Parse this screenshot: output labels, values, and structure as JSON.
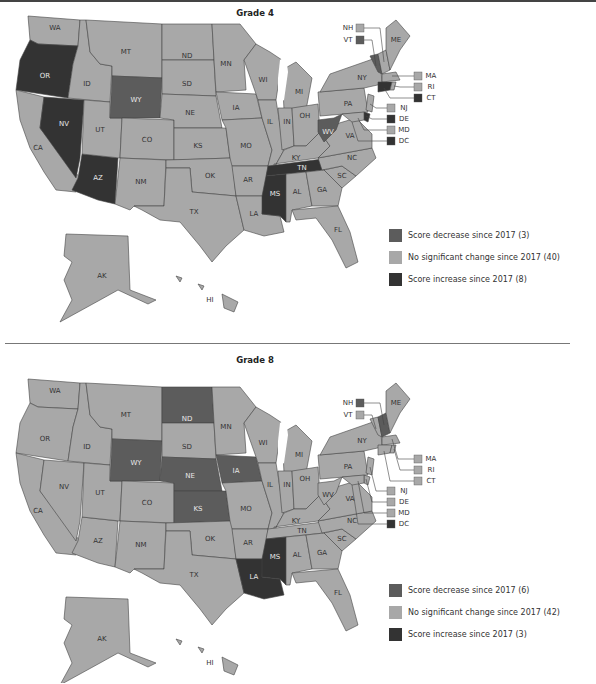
{
  "colors": {
    "decrease": "#5c5c5c",
    "no_change": "#a8a8a8",
    "increase": "#333333",
    "border": "#444444",
    "label_light": "#e8e8e8",
    "label_dark": "#333333"
  },
  "panels": [
    {
      "title": "Grade 4",
      "legend": [
        {
          "key": "decrease",
          "label": "Score decrease since 2017 (3)"
        },
        {
          "key": "no_change",
          "label": "No significant change since 2017 (40)"
        },
        {
          "key": "increase",
          "label": "Score increase since 2017 (8)"
        }
      ],
      "state_labels": {
        "WA": "WA",
        "OR": "OR",
        "CA": "CA",
        "ID": "ID",
        "NV": "NV",
        "AZ": "AZ",
        "UT": "UT",
        "MT": "MT",
        "WY": "WY",
        "CO": "CO",
        "NM": "NM",
        "ND": "ND",
        "SD": "SD",
        "NE": "NE",
        "KS": "KS",
        "OK": "OK",
        "TX": "TX",
        "MN": "MN",
        "IA": "IA",
        "MO": "MO",
        "AR": "AR",
        "LA": "LA",
        "WI": "WI",
        "IL": "IL",
        "MI": "MI",
        "IN": "IN",
        "OH": "OH",
        "KY": "KY",
        "TN": "TN",
        "MS": "MS",
        "AL": "AL",
        "GA": "GA",
        "FL": "FL",
        "SC": "SC",
        "NC": "NC",
        "VA": "VA",
        "WV": "WV",
        "PA": "PA",
        "NY": "NY",
        "ME": "ME",
        "AK": "AK",
        "HI": "HI"
      },
      "callouts": [
        {
          "label": "NH",
          "status": "no_change"
        },
        {
          "label": "VT",
          "status": "decrease"
        },
        {
          "label": "MA",
          "status": "no_change"
        },
        {
          "label": "RI",
          "status": "no_change"
        },
        {
          "label": "CT",
          "status": "increase"
        },
        {
          "label": "NJ",
          "status": "no_change"
        },
        {
          "label": "DE",
          "status": "increase"
        },
        {
          "label": "MD",
          "status": "no_change"
        },
        {
          "label": "DC",
          "status": "increase"
        }
      ],
      "status": {
        "decrease": [
          "WY",
          "WV",
          "VT"
        ],
        "increase": [
          "OR",
          "NV",
          "AZ",
          "TN",
          "MS",
          "CT",
          "DE",
          "DC"
        ]
      }
    },
    {
      "title": "Grade 8",
      "legend": [
        {
          "key": "decrease",
          "label": "Score decrease since 2017 (6)"
        },
        {
          "key": "no_change",
          "label": "No significant change since 2017 (42)"
        },
        {
          "key": "increase",
          "label": "Score increase since 2017 (3)"
        }
      ],
      "state_labels": {
        "WA": "WA",
        "OR": "OR",
        "CA": "CA",
        "ID": "ID",
        "NV": "NV",
        "AZ": "AZ",
        "UT": "UT",
        "MT": "MT",
        "WY": "WY",
        "CO": "CO",
        "NM": "NM",
        "ND": "ND",
        "SD": "SD",
        "NE": "NE",
        "KS": "KS",
        "OK": "OK",
        "TX": "TX",
        "MN": "MN",
        "IA": "IA",
        "MO": "MO",
        "AR": "AR",
        "LA": "LA",
        "WI": "WI",
        "IL": "IL",
        "MI": "MI",
        "IN": "IN",
        "OH": "OH",
        "KY": "KY",
        "TN": "TN",
        "MS": "MS",
        "AL": "AL",
        "GA": "GA",
        "FL": "FL",
        "SC": "SC",
        "NC": "NC",
        "VA": "VA",
        "WV": "WV",
        "PA": "PA",
        "NY": "NY",
        "ME": "ME",
        "AK": "AK",
        "HI": "HI"
      },
      "callouts": [
        {
          "label": "NH",
          "status": "decrease"
        },
        {
          "label": "VT",
          "status": "no_change"
        },
        {
          "label": "MA",
          "status": "no_change"
        },
        {
          "label": "RI",
          "status": "no_change"
        },
        {
          "label": "CT",
          "status": "no_change"
        },
        {
          "label": "NJ",
          "status": "no_change"
        },
        {
          "label": "DE",
          "status": "no_change"
        },
        {
          "label": "MD",
          "status": "no_change"
        },
        {
          "label": "DC",
          "status": "increase"
        }
      ],
      "status": {
        "decrease": [
          "ND",
          "WY",
          "NE",
          "IA",
          "KS",
          "NH"
        ],
        "increase": [
          "LA",
          "MS",
          "DC"
        ]
      }
    }
  ]
}
